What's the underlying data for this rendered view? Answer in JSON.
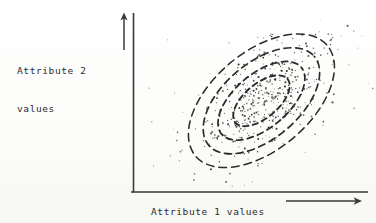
{
  "figure": {
    "background_color": "#fdfdfb",
    "ink_color": "#2b2b2b",
    "y_axis_label_line1": "Attribute 2",
    "y_axis_label_line2": "values",
    "x_axis_label": "Attribute 1 values"
  },
  "chart_data": {
    "type": "scatter",
    "title": "",
    "subtitle": "",
    "xlabel": "Attribute 1 values",
    "ylabel": "Attribute 2 values",
    "xlim": [
      0,
      1
    ],
    "ylim": [
      0,
      1
    ],
    "grid": false,
    "legend": null,
    "axis_style": {
      "x_axis_arrow": true,
      "y_axis_arrow": true,
      "tick_labels": [],
      "spines": [
        "left",
        "bottom"
      ]
    },
    "annotations": [],
    "distribution": {
      "center_x": 0.555,
      "center_y": 0.525,
      "correlation": 0.78,
      "orientation_deg": 40,
      "n_points": 430
    },
    "contours": [
      {
        "name": "contour-1-innermost",
        "level": 0.25,
        "rx": 34,
        "ry": 17
      },
      {
        "name": "contour-2",
        "level": 0.5,
        "rx": 52,
        "ry": 27
      },
      {
        "name": "contour-3",
        "level": 0.75,
        "rx": 69,
        "ry": 38
      },
      {
        "name": "contour-4-outermost",
        "level": 0.95,
        "rx": 86,
        "ry": 49
      }
    ],
    "series": [
      {
        "name": "observations",
        "marker": "dot",
        "color": "#2b2b2b",
        "x": [
          0.36,
          0.392,
          0.415,
          0.43,
          0.452,
          0.468,
          0.481,
          0.495,
          0.503,
          0.512,
          0.521,
          0.53,
          0.538,
          0.545,
          0.552,
          0.56,
          0.568,
          0.575,
          0.582,
          0.59,
          0.598,
          0.605,
          0.612,
          0.62,
          0.628,
          0.635,
          0.642,
          0.65,
          0.658,
          0.665,
          0.672,
          0.68,
          0.688,
          0.695,
          0.702,
          0.71,
          0.718,
          0.725,
          0.732,
          0.74,
          0.33,
          0.345,
          0.362,
          0.378,
          0.395,
          0.41,
          0.425,
          0.44,
          0.455,
          0.47,
          0.485,
          0.5,
          0.515,
          0.53,
          0.545,
          0.56,
          0.575,
          0.59,
          0.605,
          0.62,
          0.635,
          0.65,
          0.665,
          0.68,
          0.695,
          0.71,
          0.725,
          0.74,
          0.755,
          0.77,
          0.3,
          0.32,
          0.34,
          0.36,
          0.38,
          0.4,
          0.42,
          0.44,
          0.46,
          0.48,
          0.5,
          0.52,
          0.54,
          0.56,
          0.58,
          0.6,
          0.62,
          0.64,
          0.66,
          0.68,
          0.7,
          0.72,
          0.74,
          0.76,
          0.78,
          0.8,
          0.82,
          0.25,
          0.27,
          0.29
        ],
        "y": [
          0.33,
          0.355,
          0.372,
          0.388,
          0.402,
          0.418,
          0.43,
          0.442,
          0.452,
          0.462,
          0.47,
          0.48,
          0.488,
          0.496,
          0.504,
          0.512,
          0.52,
          0.528,
          0.536,
          0.544,
          0.552,
          0.56,
          0.568,
          0.576,
          0.584,
          0.592,
          0.6,
          0.608,
          0.616,
          0.624,
          0.632,
          0.64,
          0.648,
          0.656,
          0.664,
          0.672,
          0.68,
          0.688,
          0.696,
          0.704,
          0.28,
          0.3,
          0.32,
          0.34,
          0.358,
          0.374,
          0.39,
          0.404,
          0.418,
          0.432,
          0.446,
          0.46,
          0.474,
          0.488,
          0.502,
          0.516,
          0.53,
          0.544,
          0.558,
          0.572,
          0.586,
          0.6,
          0.614,
          0.628,
          0.642,
          0.656,
          0.67,
          0.684,
          0.698,
          0.712,
          0.24,
          0.258,
          0.276,
          0.294,
          0.312,
          0.33,
          0.348,
          0.366,
          0.384,
          0.402,
          0.42,
          0.438,
          0.456,
          0.474,
          0.492,
          0.51,
          0.528,
          0.546,
          0.564,
          0.582,
          0.6,
          0.618,
          0.636,
          0.654,
          0.672,
          0.69,
          0.708,
          0.205,
          0.222,
          0.24
        ]
      }
    ]
  }
}
